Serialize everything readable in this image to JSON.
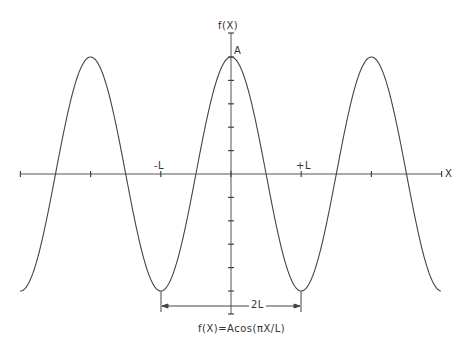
{
  "diagram": {
    "title_axis_y": "f(X)",
    "axis_x_label": "X",
    "amplitude_label": "A",
    "tick_label_neg": "-L",
    "tick_label_pos": "+L",
    "dimension_label": "2L",
    "caption": "f(X)=Acos(πX/L)",
    "colors": {
      "line": "#444444",
      "background": "#ffffff"
    }
  },
  "chart_data": {
    "type": "line",
    "title": "f(X)=Acos(πX/L)",
    "xlabel": "X",
    "ylabel": "f(X)",
    "function": "A*cos(pi*X/L)",
    "x_ticks": [
      "-3L",
      "-2L",
      "-L",
      "0",
      "+L",
      "+2L",
      "+3L"
    ],
    "x_tick_labels_shown": [
      "-L",
      "+L"
    ],
    "xlim": [
      "-3.3L",
      "+3.1L"
    ],
    "ylim": [
      "-1.3A",
      "+1.2A"
    ],
    "peaks_at": [
      "-2L",
      "0",
      "+2L"
    ],
    "troughs_at": [
      "-L",
      "+L"
    ],
    "annotations": [
      "A (amplitude at peak)",
      "2L (period, trough to trough)"
    ],
    "grid": false
  }
}
